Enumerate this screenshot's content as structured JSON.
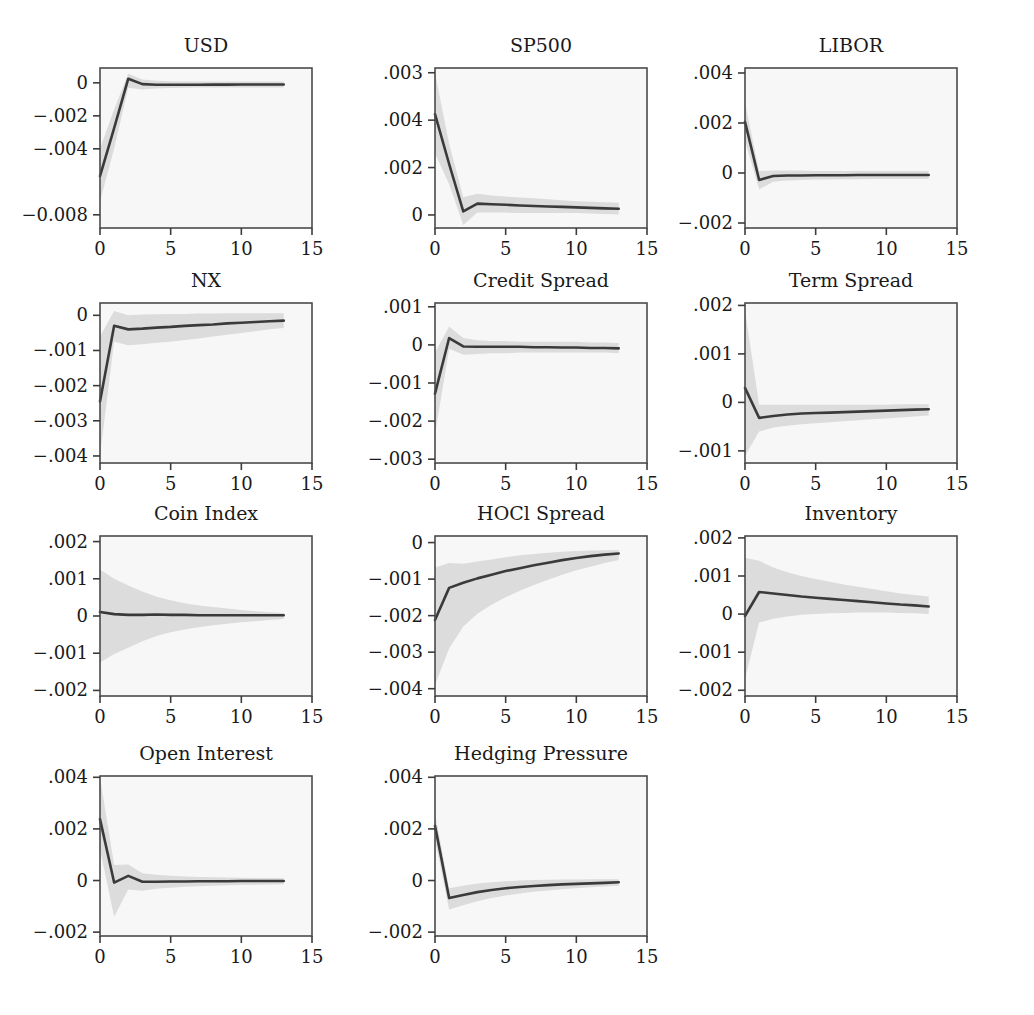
{
  "chart_data": {
    "type": "line",
    "title": "",
    "subtitle": "",
    "layout": {
      "rows": 4,
      "cols": 3,
      "panels_total": 11,
      "grid_on": false,
      "legend": "none"
    },
    "xlabel": "",
    "ylabel": "",
    "shared_x": {
      "ticks": [
        0,
        5,
        10,
        15
      ],
      "tick_labels": [
        "0",
        "5",
        "10",
        "15"
      ],
      "xlim": [
        0,
        15
      ]
    },
    "band_label": "confidence interval",
    "colors": {
      "line": "#3a3a3a",
      "band": "#dcdcdc",
      "panel_bg": "#f7f7f7",
      "border": "#4a4a4a",
      "page_bg": "#ffffff"
    },
    "panels": [
      {
        "title": "USD",
        "row": 0,
        "col": 0,
        "ytick_labels": [
          "0",
          "-.002",
          "-.004",
          "-0.008"
        ],
        "ytick_values": [
          0,
          -0.002,
          -0.004,
          -0.008
        ],
        "ylim": [
          -0.0088,
          0.0009
        ],
        "xlim": [
          0,
          15
        ],
        "x": [
          0,
          1,
          2,
          3,
          4,
          5,
          6,
          7,
          8,
          9,
          10,
          11,
          12,
          13
        ],
        "values": [
          -0.00565,
          -0.00275,
          0.00025,
          -8e-05,
          -0.00012,
          -0.00012,
          -0.00012,
          -0.00012,
          -0.00011,
          -0.00011,
          -0.0001,
          -0.0001,
          -0.0001,
          -0.0001
        ],
        "ci_upper": [
          -0.004,
          -0.0016,
          0.00055,
          0.0002,
          0.00012,
          0.0001,
          8e-05,
          8e-05,
          8e-05,
          8e-05,
          8e-05,
          8e-05,
          8e-05,
          8e-05
        ],
        "ci_lower": [
          -0.0072,
          -0.004,
          -0.0003,
          -0.0004,
          -0.00035,
          -0.00032,
          -0.0003,
          -0.00028,
          -0.00028,
          -0.00028,
          -0.00028,
          -0.00028,
          -0.00028,
          -0.00028
        ]
      },
      {
        "title": "SP500",
        "row": 0,
        "col": 1,
        "ytick_labels": [
          ".003",
          ".004",
          ".002",
          "0"
        ],
        "ytick_values": [
          0.006,
          0.004,
          0.002,
          0
        ],
        "ylim": [
          -0.00055,
          0.0062
        ],
        "xlim": [
          0,
          15
        ],
        "x": [
          0,
          1,
          2,
          3,
          4,
          5,
          6,
          7,
          8,
          9,
          10,
          11,
          12,
          13
        ],
        "values": [
          0.00425,
          0.00215,
          0.00015,
          0.00048,
          0.00045,
          0.00043,
          0.0004,
          0.00038,
          0.00036,
          0.00034,
          0.00032,
          0.0003,
          0.00028,
          0.00026
        ],
        "ci_upper": [
          0.006,
          0.003,
          0.00075,
          0.0009,
          0.00082,
          0.00078,
          0.00074,
          0.0007,
          0.00066,
          0.00062,
          0.00058,
          0.00056,
          0.00054,
          0.00052
        ],
        "ci_lower": [
          0.0026,
          0.0013,
          -0.00042,
          0.0001,
          0.0001,
          0.0001,
          8e-05,
          8e-05,
          8e-05,
          8e-05,
          8e-05,
          6e-05,
          4e-05,
          2e-05
        ]
      },
      {
        "title": "LIBOR",
        "row": 0,
        "col": 2,
        "ytick_labels": [
          ".004",
          ".002",
          "0",
          "-.002"
        ],
        "ytick_values": [
          0.004,
          0.002,
          0,
          -0.002
        ],
        "ylim": [
          -0.0022,
          0.0042
        ],
        "xlim": [
          0,
          15
        ],
        "x": [
          0,
          1,
          2,
          3,
          4,
          5,
          6,
          7,
          8,
          9,
          10,
          11,
          12,
          13
        ],
        "values": [
          0.00205,
          -0.00028,
          -0.00012,
          -0.0001,
          -0.0001,
          -9e-05,
          -9e-05,
          -9e-05,
          -8e-05,
          -8e-05,
          -8e-05,
          -8e-05,
          -8e-05,
          -8e-05
        ],
        "ci_upper": [
          0.0028,
          8e-05,
          0.0001,
          0.0001,
          0.0001,
          8e-05,
          8e-05,
          8e-05,
          8e-05,
          8e-05,
          8e-05,
          8e-05,
          8e-05,
          8e-05
        ],
        "ci_lower": [
          0.0013,
          -0.00065,
          -0.00035,
          -0.0003,
          -0.00028,
          -0.00026,
          -0.00026,
          -0.00025,
          -0.00025,
          -0.00024,
          -0.00024,
          -0.00024,
          -0.00024,
          -0.00024
        ]
      },
      {
        "title": "NX",
        "row": 1,
        "col": 0,
        "ytick_labels": [
          "0",
          "-.001",
          "-.002",
          "-.003",
          "-.004"
        ],
        "ytick_values": [
          0,
          -0.001,
          -0.002,
          -0.003,
          -0.004
        ],
        "ylim": [
          -0.0042,
          0.00035
        ],
        "xlim": [
          0,
          15
        ],
        "x": [
          0,
          1,
          2,
          3,
          4,
          5,
          6,
          7,
          8,
          9,
          10,
          11,
          12,
          13
        ],
        "values": [
          -0.00245,
          -0.0003,
          -0.0004,
          -0.00038,
          -0.00035,
          -0.00033,
          -0.0003,
          -0.00028,
          -0.00026,
          -0.00023,
          -0.00021,
          -0.00019,
          -0.00017,
          -0.00015
        ],
        "ci_upper": [
          -0.0006,
          0.00012,
          0.0,
          2e-05,
          3e-05,
          4e-05,
          4e-05,
          5e-05,
          5e-05,
          6e-05,
          6e-05,
          6e-05,
          6e-05,
          6e-05
        ],
        "ci_lower": [
          -0.004,
          -0.00075,
          -0.00085,
          -0.00082,
          -0.00078,
          -0.00075,
          -0.0007,
          -0.00066,
          -0.0006,
          -0.00055,
          -0.0005,
          -0.00045,
          -0.0004,
          -0.00036
        ]
      },
      {
        "title": "Credit Spread",
        "row": 1,
        "col": 1,
        "ytick_labels": [
          ".001",
          "0",
          "-.001",
          "-.002",
          "-.003"
        ],
        "ytick_values": [
          0.001,
          0,
          -0.001,
          -0.002,
          -0.003
        ],
        "ylim": [
          -0.0031,
          0.0011
        ],
        "xlim": [
          0,
          15
        ],
        "x": [
          0,
          1,
          2,
          3,
          4,
          5,
          6,
          7,
          8,
          9,
          10,
          11,
          12,
          13
        ],
        "values": [
          -0.00128,
          0.00018,
          -4e-05,
          -5e-05,
          -5e-05,
          -5e-05,
          -5e-05,
          -6e-05,
          -6e-05,
          -7e-05,
          -7e-05,
          -8e-05,
          -8e-05,
          -9e-05
        ],
        "ci_upper": [
          -0.0002,
          0.00048,
          0.00018,
          0.00012,
          0.0001,
          0.0001,
          8e-05,
          8e-05,
          8e-05,
          8e-05,
          8e-05,
          6e-05,
          6e-05,
          5e-05
        ],
        "ci_lower": [
          -0.00235,
          -0.0001,
          -0.00026,
          -0.00024,
          -0.00022,
          -0.00022,
          -0.0002,
          -0.0002,
          -0.0002,
          -0.0002,
          -0.0002,
          -0.0002,
          -0.0002,
          -0.00022
        ]
      },
      {
        "title": "Term Spread",
        "row": 1,
        "col": 2,
        "ytick_labels": [
          ".002",
          ".001",
          "0",
          "-.001"
        ],
        "ytick_values": [
          0.002,
          0.001,
          0,
          -0.001
        ],
        "ylim": [
          -0.00125,
          0.00205
        ],
        "xlim": [
          0,
          15
        ],
        "x": [
          0,
          1,
          2,
          3,
          4,
          5,
          6,
          7,
          8,
          9,
          10,
          11,
          12,
          13
        ],
        "values": [
          0.0003,
          -0.00032,
          -0.00028,
          -0.00025,
          -0.00023,
          -0.00022,
          -0.00021,
          -0.0002,
          -0.00019,
          -0.00018,
          -0.00017,
          -0.00016,
          -0.00015,
          -0.00014
        ],
        "ci_upper": [
          0.0019,
          -5e-05,
          -5e-05,
          -5e-05,
          -5e-05,
          -5e-05,
          -5e-05,
          -5e-05,
          -5e-05,
          -5e-05,
          -5e-05,
          -4e-05,
          -4e-05,
          -4e-05
        ],
        "ci_lower": [
          -0.0011,
          -0.0006,
          -0.00052,
          -0.00048,
          -0.00045,
          -0.00043,
          -0.00041,
          -0.00039,
          -0.00037,
          -0.00035,
          -0.00033,
          -0.00031,
          -0.00029,
          -0.00027
        ]
      },
      {
        "title": "Coin Index",
        "row": 2,
        "col": 0,
        "ytick_labels": [
          ".002",
          ".001",
          "0",
          "-.001",
          "-.002"
        ],
        "ytick_values": [
          0.002,
          0.001,
          0,
          -0.001,
          -0.002
        ],
        "ylim": [
          -0.00215,
          0.00215
        ],
        "xlim": [
          0,
          15
        ],
        "x": [
          0,
          1,
          2,
          3,
          4,
          5,
          6,
          7,
          8,
          9,
          10,
          11,
          12,
          13
        ],
        "values": [
          0.00011,
          5e-05,
          3e-05,
          3e-05,
          4e-05,
          3e-05,
          3e-05,
          2e-05,
          2e-05,
          2e-05,
          2e-05,
          2e-05,
          2e-05,
          2e-05
        ],
        "ci_upper": [
          0.00125,
          0.001,
          0.00082,
          0.00066,
          0.00052,
          0.00042,
          0.00034,
          0.00028,
          0.00024,
          0.0002,
          0.00016,
          0.00013,
          0.0001,
          8e-05
        ],
        "ci_lower": [
          -0.00125,
          -0.00102,
          -0.00085,
          -0.00068,
          -0.00054,
          -0.00044,
          -0.00036,
          -0.0003,
          -0.00025,
          -0.00021,
          -0.00017,
          -0.00014,
          -0.00011,
          -8e-05
        ]
      },
      {
        "title": "HOCl Spread",
        "row": 2,
        "col": 1,
        "ytick_labels": [
          "0",
          "-.001",
          "-.002",
          "-.003",
          "-.004"
        ],
        "ytick_values": [
          0,
          -0.001,
          -0.002,
          -0.003,
          -0.004
        ],
        "ylim": [
          -0.0042,
          0.00018
        ],
        "xlim": [
          0,
          15
        ],
        "x": [
          0,
          1,
          2,
          3,
          4,
          5,
          6,
          7,
          8,
          9,
          10,
          11,
          12,
          13
        ],
        "values": [
          -0.00212,
          -0.00124,
          -0.0011,
          -0.00098,
          -0.00088,
          -0.00078,
          -0.0007,
          -0.00062,
          -0.00055,
          -0.00048,
          -0.00042,
          -0.00037,
          -0.00033,
          -0.0003
        ],
        "ci_upper": [
          -0.00068,
          -0.00056,
          -0.00058,
          -0.00052,
          -0.00046,
          -0.0004,
          -0.00035,
          -0.00031,
          -0.00028,
          -0.00025,
          -0.00023,
          -0.00022,
          -0.00021,
          -0.0002
        ],
        "ci_lower": [
          -0.0039,
          -0.0029,
          -0.0023,
          -0.00195,
          -0.0017,
          -0.0015,
          -0.00132,
          -0.00116,
          -0.00102,
          -0.00088,
          -0.00076,
          -0.00066,
          -0.00056,
          -0.00048
        ]
      },
      {
        "title": "Inventory",
        "row": 2,
        "col": 2,
        "ytick_labels": [
          ".002",
          ".001",
          "0",
          "-.001",
          "-.002"
        ],
        "ytick_values": [
          0.002,
          0.001,
          0,
          -0.001,
          -0.002
        ],
        "ylim": [
          -0.00215,
          0.00205
        ],
        "xlim": [
          0,
          15
        ],
        "x": [
          0,
          1,
          2,
          3,
          4,
          5,
          6,
          7,
          8,
          9,
          10,
          11,
          12,
          13
        ],
        "values": [
          -5e-05,
          0.00058,
          0.00054,
          0.0005,
          0.00046,
          0.00043,
          0.0004,
          0.00037,
          0.00034,
          0.00031,
          0.00028,
          0.00025,
          0.00023,
          0.0002
        ],
        "ci_upper": [
          0.00148,
          0.0014,
          0.00122,
          0.0011,
          0.001,
          0.00092,
          0.00085,
          0.00078,
          0.00072,
          0.00066,
          0.0006,
          0.00054,
          0.0005,
          0.00046
        ],
        "ci_lower": [
          -0.0017,
          -0.00022,
          -0.00012,
          -6e-05,
          -2e-05,
          0.0,
          2e-05,
          3e-05,
          4e-05,
          4e-05,
          4e-05,
          3e-05,
          2e-05,
          0.0
        ]
      },
      {
        "title": "Open Interest",
        "row": 3,
        "col": 0,
        "ytick_labels": [
          ".004",
          ".002",
          "0",
          "-.002"
        ],
        "ytick_values": [
          0.004,
          0.002,
          0,
          -0.002
        ],
        "ylim": [
          -0.00215,
          0.00405
        ],
        "xlim": [
          0,
          15
        ],
        "x": [
          0,
          1,
          2,
          3,
          4,
          5,
          6,
          7,
          8,
          9,
          10,
          11,
          12,
          13
        ],
        "values": [
          0.00238,
          -8e-05,
          0.00018,
          -5e-05,
          -5e-05,
          -4e-05,
          -4e-05,
          -3e-05,
          -3e-05,
          -3e-05,
          -2e-05,
          -2e-05,
          -2e-05,
          -2e-05
        ],
        "ci_upper": [
          0.004,
          0.0006,
          0.00062,
          0.00028,
          0.00022,
          0.00018,
          0.00016,
          0.00014,
          0.00013,
          0.00012,
          0.00011,
          0.0001,
          0.0001,
          9e-05
        ],
        "ci_lower": [
          0.0012,
          -0.0014,
          -0.00035,
          -0.0004,
          -0.00032,
          -0.00028,
          -0.00024,
          -0.00022,
          -0.0002,
          -0.00018,
          -0.00017,
          -0.00016,
          -0.00015,
          -0.00014
        ]
      },
      {
        "title": "Hedging Pressure",
        "row": 3,
        "col": 1,
        "ytick_labels": [
          ".004",
          ".002",
          "0",
          "-.002"
        ],
        "ytick_values": [
          0.004,
          0.002,
          0,
          -0.002
        ],
        "ylim": [
          -0.00215,
          0.00405
        ],
        "xlim": [
          0,
          15
        ],
        "x": [
          0,
          1,
          2,
          3,
          4,
          5,
          6,
          7,
          8,
          9,
          10,
          11,
          12,
          13
        ],
        "values": [
          0.00212,
          -0.00068,
          -0.00056,
          -0.00045,
          -0.00037,
          -0.0003,
          -0.00025,
          -0.00021,
          -0.00018,
          -0.00015,
          -0.00013,
          -0.00011,
          -9e-05,
          -7e-05
        ],
        "ci_upper": [
          0.0026,
          -0.0003,
          -0.0002,
          -0.00012,
          -7e-05,
          -3e-05,
          0.0,
          2e-05,
          3e-05,
          4e-05,
          4e-05,
          5e-05,
          5e-05,
          5e-05
        ],
        "ci_lower": [
          0.0016,
          -0.00112,
          -0.00096,
          -0.0008,
          -0.00068,
          -0.00058,
          -0.0005,
          -0.00044,
          -0.00039,
          -0.00034,
          -0.0003,
          -0.00026,
          -0.00023,
          -0.0002
        ]
      }
    ]
  }
}
